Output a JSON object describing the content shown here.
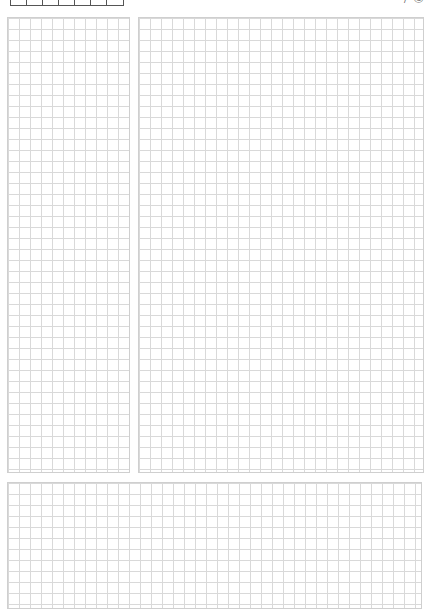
{
  "page": {
    "type": "graph-paper-notebook-page",
    "grid_color": "#d9d9d9",
    "border_color": "#cfcfcf",
    "grid_cell_px": 11
  },
  "header": {
    "date_cells_count": 7,
    "corner_label": "/ ©"
  },
  "panels": [
    {
      "id": "left",
      "label": ""
    },
    {
      "id": "right",
      "label": ""
    },
    {
      "id": "bottom",
      "label": ""
    }
  ]
}
